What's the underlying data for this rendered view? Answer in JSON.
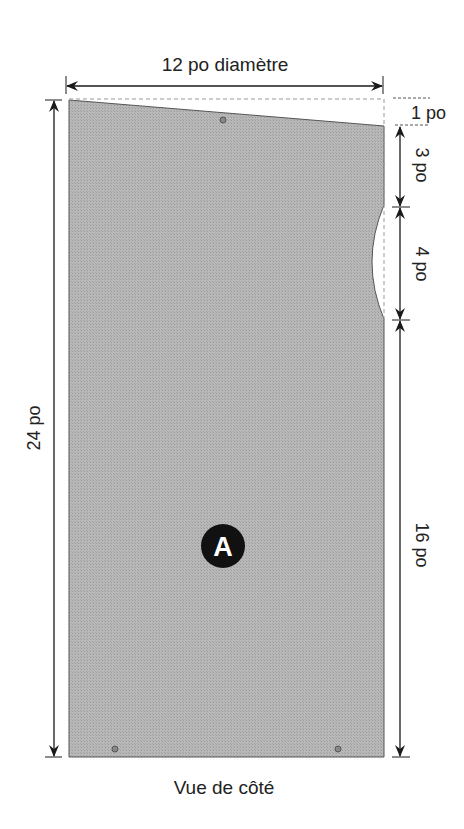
{
  "diagram": {
    "title": "Vue de côté",
    "part_label": "A",
    "colors": {
      "panel": "#b4b4b4",
      "line": "#1a1a1a",
      "dash": "#888888",
      "badge": "#111111"
    },
    "dimensions": {
      "width": "12 po diamètre",
      "height": "24 po",
      "top_slope": "1 po",
      "upper_gap": "3 po",
      "cutout": "4 po",
      "lower": "16 po"
    }
  }
}
